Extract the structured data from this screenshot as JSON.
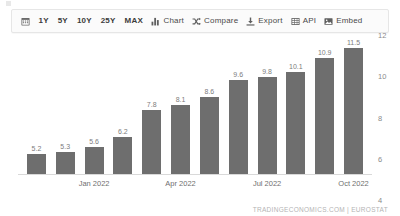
{
  "toolbar": {
    "calendar_icon": "calendar-icon",
    "ranges": [
      {
        "label": "1Y"
      },
      {
        "label": "5Y"
      },
      {
        "label": "10Y"
      },
      {
        "label": "25Y"
      },
      {
        "label": "MAX"
      }
    ],
    "actions": [
      {
        "label": "Chart",
        "icon": "bar-chart-icon"
      },
      {
        "label": "Compare",
        "icon": "compare-shuffle-icon"
      },
      {
        "label": "Export",
        "icon": "download-export-icon"
      },
      {
        "label": "API",
        "icon": "grid-api-icon"
      },
      {
        "label": "Embed",
        "icon": "image-embed-icon"
      }
    ]
  },
  "chart_data": {
    "type": "bar",
    "title": "",
    "subtitle": "",
    "xlabel": "",
    "ylabel": "",
    "ylim": [
      4,
      12
    ],
    "yticks": [
      4,
      6,
      8,
      10,
      12
    ],
    "ytick_labels": [
      "4",
      "6",
      "8",
      "10",
      "12"
    ],
    "grid": false,
    "legend": "none",
    "bar_color": "#6e6e6e",
    "categories": [
      "Nov 2021",
      "Dec 2021",
      "Jan 2022",
      "Feb 2022",
      "Mar 2022",
      "Apr 2022",
      "May 2022",
      "Jun 2022",
      "Jul 2022",
      "Aug 2022",
      "Sep 2022",
      "Oct 2022"
    ],
    "values": [
      5.2,
      5.3,
      5.6,
      6.2,
      7.8,
      8.1,
      8.6,
      9.6,
      9.8,
      10.1,
      10.9,
      11.5
    ],
    "value_labels": [
      "5.2",
      "5.3",
      "5.6",
      "6.2",
      "7.8",
      "8.1",
      "8.6",
      "9.6",
      "9.8",
      "10.1",
      "10.9",
      "11.5"
    ],
    "xtick_labels": [
      "Jan 2022",
      "Apr 2022",
      "Jul 2022",
      "Oct 2022"
    ],
    "xtick_indices": [
      2,
      5,
      8,
      11
    ]
  },
  "footer": {
    "attribution": "TRADINGECONOMICS.COM | EUROSTAT"
  }
}
